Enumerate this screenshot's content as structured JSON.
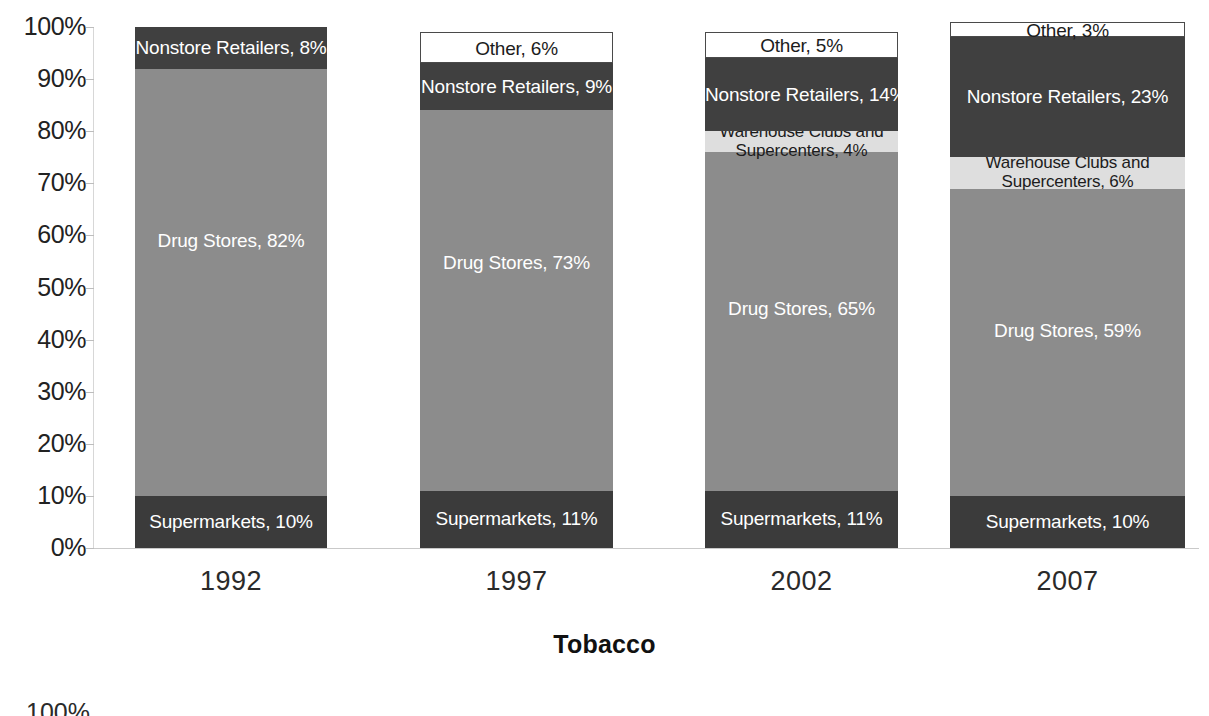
{
  "chart_data": {
    "type": "bar",
    "subtype": "stacked-100-percent",
    "title": "Tobacco",
    "xlabel": "",
    "ylabel": "",
    "ylim": [
      0,
      100
    ],
    "grid": false,
    "legend": "none (labels drawn inside segments)",
    "categories": [
      "1992",
      "1997",
      "2002",
      "2007"
    ],
    "y_ticks": [
      "0%",
      "10%",
      "20%",
      "30%",
      "40%",
      "50%",
      "60%",
      "70%",
      "80%",
      "90%",
      "100%"
    ],
    "series": [
      {
        "name": "Supermarkets",
        "values": [
          10,
          11,
          11,
          10
        ],
        "color": "#3b3b3b"
      },
      {
        "name": "Drug Stores",
        "values": [
          82,
          73,
          65,
          59
        ],
        "color": "#8c8c8c"
      },
      {
        "name": "Warehouse Clubs and Supercenters",
        "values": [
          0,
          0,
          4,
          6
        ],
        "color": "#dedede"
      },
      {
        "name": "Nonstore Retailers",
        "values": [
          8,
          9,
          14,
          23
        ],
        "color": "#404040"
      },
      {
        "name": "Other",
        "values": [
          0,
          6,
          5,
          3
        ],
        "color": "#ffffff"
      }
    ],
    "bars": [
      {
        "category": "1992",
        "segments": [
          {
            "name": "Supermarkets",
            "value": 10,
            "label": "Supermarkets, 10%",
            "label_color": "light"
          },
          {
            "name": "Drug Stores",
            "value": 82,
            "label": "Drug Stores, 82%",
            "label_color": "light"
          },
          {
            "name": "Nonstore Retailers",
            "value": 8,
            "label": "Nonstore Retailers, 8%",
            "label_color": "light"
          }
        ]
      },
      {
        "category": "1997",
        "segments": [
          {
            "name": "Supermarkets",
            "value": 11,
            "label": "Supermarkets, 11%",
            "label_color": "light"
          },
          {
            "name": "Drug Stores",
            "value": 73,
            "label": "Drug Stores, 73%",
            "label_color": "light"
          },
          {
            "name": "Nonstore Retailers",
            "value": 9,
            "label": "Nonstore Retailers, 9%",
            "label_color": "light"
          },
          {
            "name": "Other",
            "value": 6,
            "label": "Other, 6%",
            "label_color": "dark"
          }
        ]
      },
      {
        "category": "2002",
        "segments": [
          {
            "name": "Supermarkets",
            "value": 11,
            "label": "Supermarkets, 11%",
            "label_color": "light"
          },
          {
            "name": "Drug Stores",
            "value": 65,
            "label": "Drug Stores, 65%",
            "label_color": "light"
          },
          {
            "name": "Warehouse Clubs and Supercenters",
            "value": 4,
            "label": "Warehouse Clubs and Supercenters, 4%",
            "label_color": "dark"
          },
          {
            "name": "Nonstore Retailers",
            "value": 14,
            "label": "Nonstore Retailers, 14%",
            "label_color": "light"
          },
          {
            "name": "Other",
            "value": 5,
            "label": "Other, 5%",
            "label_color": "dark"
          }
        ]
      },
      {
        "category": "2007",
        "segments": [
          {
            "name": "Supermarkets",
            "value": 10,
            "label": "Supermarkets, 10%",
            "label_color": "light"
          },
          {
            "name": "Drug Stores",
            "value": 59,
            "label": "Drug Stores, 59%",
            "label_color": "light"
          },
          {
            "name": "Warehouse Clubs and Supercenters",
            "value": 6,
            "label": "Warehouse Clubs and Supercenters, 6%",
            "label_color": "dark"
          },
          {
            "name": "Nonstore Retailers",
            "value": 23,
            "label": "Nonstore Retailers, 23%",
            "label_color": "light"
          },
          {
            "name": "Other",
            "value": 3,
            "label": "Other, 3%",
            "label_color": "dark"
          }
        ]
      }
    ]
  },
  "colors": {
    "supermarkets": "#3b3b3b",
    "drug_stores": "#8c8c8c",
    "warehouse_clubs": "#dedede",
    "nonstore_retailers": "#404040",
    "other": "#ffffff",
    "axis": "#c9c9c9",
    "text": "#1a1a1a"
  },
  "page_bleed": {
    "next_chart_axis_top_label": "100%"
  }
}
